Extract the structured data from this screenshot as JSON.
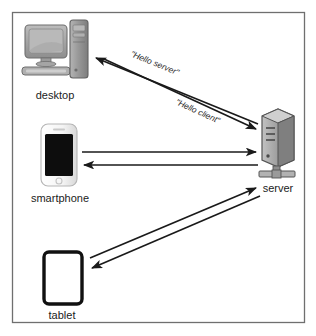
{
  "diagram": {
    "frame": {
      "border_color": "#6f6f6f",
      "background": "#ffffff"
    },
    "colors": {
      "arrow": "#1a1a1a",
      "label_text": "#1b1b1b",
      "message_text": "#2a2a2a",
      "desktop_gray": "#9a9a9a",
      "tower_gray": "#8c8c8c",
      "server_gray": "#8f8f8f",
      "phone_body": "#f2f2f2",
      "phone_screen": "#0d0d0d",
      "tablet_border": "#111111",
      "tablet_screen": "#ffffff"
    },
    "nodes": [
      {
        "id": "desktop",
        "label": "desktop",
        "icon": "desktop-computer-icon",
        "x": 55,
        "y": 52
      },
      {
        "id": "smartphone",
        "label": "smartphone",
        "icon": "smartphone-icon",
        "x": 60,
        "y": 155
      },
      {
        "id": "tablet",
        "label": "tablet",
        "icon": "tablet-icon",
        "x": 62,
        "y": 278
      },
      {
        "id": "server",
        "label": "server",
        "icon": "server-rack-icon",
        "x": 277,
        "y": 145
      }
    ],
    "connections": [
      {
        "id": "desktop-to-server",
        "from": "desktop",
        "to": "server",
        "direction": "to-server",
        "label": "\"Hello client\""
      },
      {
        "id": "server-to-desktop",
        "from": "server",
        "to": "desktop",
        "direction": "to-client",
        "label": "\"Hello server\""
      },
      {
        "id": "smartphone-to-server",
        "from": "smartphone",
        "to": "server",
        "direction": "to-server",
        "label": ""
      },
      {
        "id": "server-to-smartphone",
        "from": "server",
        "to": "smartphone",
        "direction": "to-client",
        "label": ""
      },
      {
        "id": "tablet-to-server",
        "from": "tablet",
        "to": "server",
        "direction": "to-server",
        "label": ""
      },
      {
        "id": "server-to-tablet",
        "from": "server",
        "to": "tablet",
        "direction": "to-client",
        "label": ""
      }
    ]
  }
}
